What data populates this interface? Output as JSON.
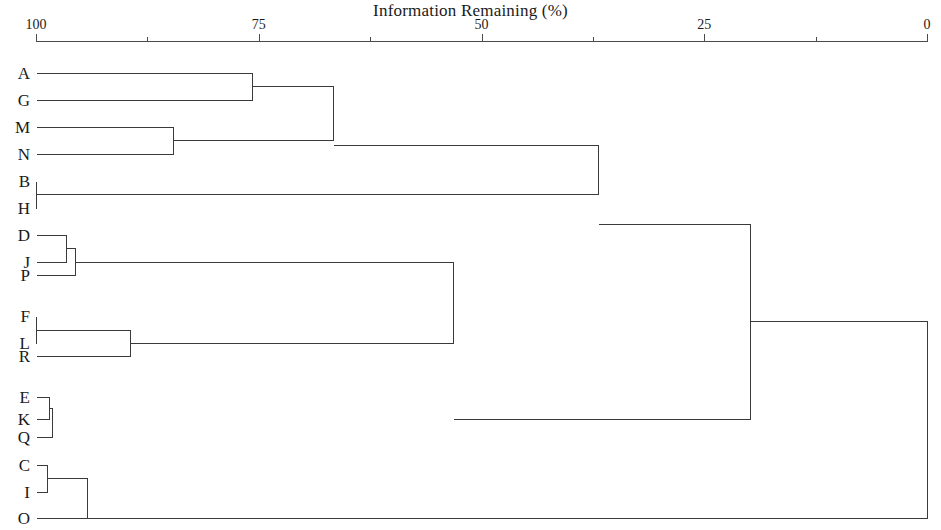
{
  "chart_data": {
    "type": "dendrogram",
    "title": "Information Remaining (%)",
    "xlabel": "Information Remaining (%)",
    "ylabel": "",
    "grid": false,
    "legend": null,
    "axis": {
      "orientation": "top",
      "reversed": true,
      "xlim": [
        100,
        0
      ],
      "major_ticks": [
        100,
        75,
        50,
        25,
        0
      ],
      "major_tick_labels": [
        "100",
        "75",
        "50",
        "25",
        "0"
      ],
      "minor_ticks": [
        87.5,
        62.5,
        37.5,
        12.5
      ],
      "pixel_left": 36,
      "pixel_right": 927
    },
    "leaves": [
      {
        "label": "A",
        "y": 73
      },
      {
        "label": "G",
        "y": 100
      },
      {
        "label": "M",
        "y": 127
      },
      {
        "label": "N",
        "y": 154
      },
      {
        "label": "B",
        "y": 181
      },
      {
        "label": "H",
        "y": 208
      },
      {
        "label": "D",
        "y": 235
      },
      {
        "label": "J",
        "y": 262
      },
      {
        "label": "P",
        "y": 275
      },
      {
        "label": "F",
        "y": 316
      },
      {
        "label": "L",
        "y": 343
      },
      {
        "label": "R",
        "y": 356
      },
      {
        "label": "E",
        "y": 397
      },
      {
        "label": "K",
        "y": 419
      },
      {
        "label": "Q",
        "y": 437
      },
      {
        "label": "C",
        "y": 465
      },
      {
        "label": "I",
        "y": 492
      },
      {
        "label": "O",
        "y": 518
      }
    ],
    "merges": [
      {
        "id": "n1",
        "members": [
          "A",
          "G"
        ],
        "information_remaining": 75.8,
        "x": 252,
        "y_top": 73,
        "y_bottom": 100
      },
      {
        "id": "n2",
        "members": [
          "M",
          "N"
        ],
        "information_remaining": 84.6,
        "x": 173,
        "y_top": 127,
        "y_bottom": 154
      },
      {
        "id": "n3",
        "members": [
          "A",
          "G",
          "M",
          "N"
        ],
        "information_remaining": 66.7,
        "x": 333,
        "y_top": 86,
        "y_bottom": 140
      },
      {
        "id": "n4",
        "members": [
          "B",
          "H"
        ],
        "information_remaining": 99.9,
        "x": 36,
        "y_top": 181,
        "y_bottom": 208
      },
      {
        "id": "n5",
        "members": [
          "A",
          "G",
          "M",
          "N",
          "B",
          "H"
        ],
        "information_remaining": 36.9,
        "x": 598,
        "y_top": 145,
        "y_bottom": 194
      },
      {
        "id": "n6",
        "members": [
          "D",
          "J"
        ],
        "information_remaining": 96.5,
        "x": 66,
        "y_top": 235,
        "y_bottom": 262
      },
      {
        "id": "n7",
        "members": [
          "D",
          "J",
          "P"
        ],
        "information_remaining": 95.6,
        "x": 75,
        "y_top": 248,
        "y_bottom": 275
      },
      {
        "id": "n8",
        "members": [
          "F",
          "L"
        ],
        "information_remaining": 99.9,
        "x": 36,
        "y_top": 316,
        "y_bottom": 343
      },
      {
        "id": "n9",
        "members": [
          "F",
          "L",
          "R"
        ],
        "information_remaining": 89.4,
        "x": 130,
        "y_top": 330,
        "y_bottom": 356
      },
      {
        "id": "n10",
        "members": [
          "D",
          "J",
          "P",
          "F",
          "L",
          "R"
        ],
        "information_remaining": 53.2,
        "x": 453,
        "y_top": 262,
        "y_bottom": 343
      },
      {
        "id": "n11",
        "members": [
          "E",
          "K"
        ],
        "information_remaining": 98.5,
        "x": 49,
        "y_top": 397,
        "y_bottom": 419
      },
      {
        "id": "n12",
        "members": [
          "E",
          "K",
          "Q"
        ],
        "information_remaining": 98.2,
        "x": 52,
        "y_top": 408,
        "y_bottom": 437
      },
      {
        "id": "n13",
        "members": [
          "C",
          "I"
        ],
        "information_remaining": 98.8,
        "x": 47,
        "y_top": 465,
        "y_bottom": 492
      },
      {
        "id": "n14",
        "members": [
          "C",
          "I",
          "O"
        ],
        "information_remaining": 94.2,
        "x": 87,
        "y_top": 478,
        "y_bottom": 518
      },
      {
        "id": "n15",
        "members": [
          "A",
          "G",
          "M",
          "N",
          "B",
          "H",
          "D",
          "J",
          "P",
          "F",
          "L",
          "R"
        ],
        "information_remaining": 19.8,
        "x": 750,
        "y_top": 224,
        "y_bottom": 419
      },
      {
        "id": "n16",
        "members": [
          "A",
          "G",
          "M",
          "N",
          "B",
          "H",
          "D",
          "J",
          "P",
          "F",
          "L",
          "R",
          "E",
          "K",
          "Q",
          "C",
          "I",
          "O"
        ],
        "information_remaining": 1.5,
        "x": 927,
        "y_top": 321,
        "y_bottom": 518
      }
    ],
    "link_color": "#3a3a3a",
    "axis_color": "#4a4a4a",
    "background_color": "#ffffff"
  }
}
